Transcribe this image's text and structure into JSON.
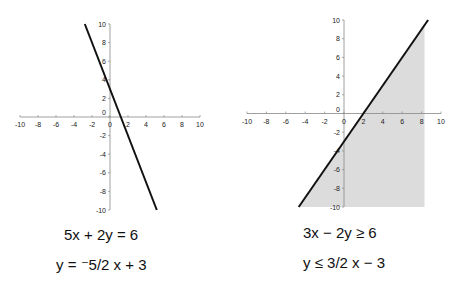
{
  "chart_data": [
    {
      "type": "line",
      "title": "",
      "equation_standard": "5x + 2y = 6",
      "equation_slope_intercept": "y = ⁻5/2 x + 3",
      "xlim": [
        -10,
        10
      ],
      "ylim": [
        -10,
        10
      ],
      "x_ticks": [
        "-10",
        "-8",
        "-6",
        "-4",
        "-2",
        "0",
        "2",
        "4",
        "6",
        "8",
        "10"
      ],
      "y_ticks": [
        "10",
        "8",
        "6",
        "4",
        "2",
        "0",
        "-2",
        "-4",
        "-6",
        "-8",
        "-10"
      ],
      "series": [
        {
          "name": "y = -5/2x + 3",
          "x": [
            -2.8,
            5.2
          ],
          "y": [
            10,
            -10
          ]
        }
      ],
      "grid": false,
      "shaded": false
    },
    {
      "type": "area",
      "title": "",
      "equation_standard": "3x − 2y ≥ 6",
      "equation_slope_intercept": "y ≤ 3/2 x − 3",
      "xlim": [
        -10,
        10
      ],
      "ylim": [
        -10,
        10
      ],
      "x_ticks": [
        "-10",
        "-8",
        "-6",
        "-4",
        "-2",
        "0",
        "2",
        "4",
        "6",
        "8",
        "10"
      ],
      "y_ticks": [
        "10",
        "8",
        "6",
        "4",
        "2",
        "0",
        "-2",
        "-4",
        "-6",
        "-8",
        "-10"
      ],
      "series": [
        {
          "name": "y = 3/2x - 3",
          "x": [
            -4.67,
            8.67
          ],
          "y": [
            -10,
            10
          ]
        }
      ],
      "shaded_region": {
        "description": "below line",
        "x_max": 8.3,
        "y_min": -10,
        "color": "#dcdcdc"
      },
      "grid": false,
      "shaded": true
    }
  ],
  "equations": {
    "left": {
      "line1": "5x + 2y = 6",
      "line2": "y = ⁻5/2 x + 3"
    },
    "right": {
      "line1": "3x − 2y ≥ 6",
      "line2": "y ≤ 3/2 x − 3"
    }
  },
  "colors": {
    "line": "#111111",
    "axis": "#888888",
    "shade": "#dcdcdc"
  }
}
